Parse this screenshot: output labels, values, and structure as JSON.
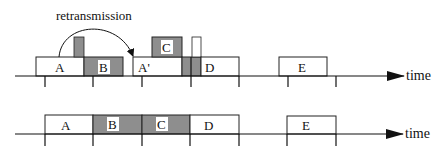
{
  "colors": {
    "gray_fill": "#8e8e8e",
    "stroke": "#222222",
    "white": "#ffffff"
  },
  "annotation": {
    "label": "retransmission"
  },
  "top_timeline": {
    "axis_label": "time",
    "frames": [
      {
        "label": "A",
        "fill": "white"
      },
      {
        "label": "B",
        "fill": "gray"
      },
      {
        "label": "A'",
        "fill": "white"
      },
      {
        "label": "C",
        "fill": "gray"
      },
      {
        "label": "D",
        "fill": "white"
      },
      {
        "label": "E",
        "fill": "white"
      }
    ]
  },
  "bottom_timeline": {
    "axis_label": "time",
    "frames": [
      {
        "label": "A",
        "fill": "white"
      },
      {
        "label": "B",
        "fill": "gray"
      },
      {
        "label": "C",
        "fill": "gray"
      },
      {
        "label": "D",
        "fill": "white"
      },
      {
        "label": "E",
        "fill": "white"
      }
    ]
  }
}
